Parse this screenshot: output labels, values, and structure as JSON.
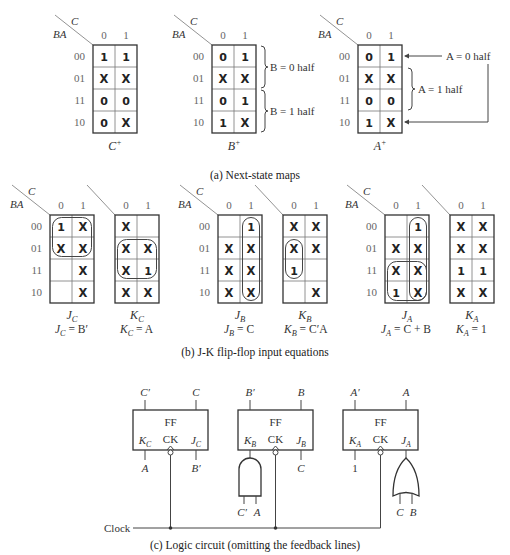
{
  "section_a": {
    "caption": "(a) Next-state maps",
    "col_var": "C",
    "row_var": "BA",
    "col_labels": [
      "0",
      "1"
    ],
    "row_labels": [
      "00",
      "01",
      "11",
      "10"
    ],
    "maps": [
      {
        "id": "C_next",
        "title": "C",
        "title_sup": "+",
        "x": 93,
        "y": 45,
        "cells": [
          [
            "1",
            "1"
          ],
          [
            "X",
            "X"
          ],
          [
            "0",
            "0"
          ],
          [
            "0",
            "X"
          ]
        ]
      },
      {
        "id": "B_next",
        "title": "B",
        "title_sup": "+",
        "x": 212,
        "y": 45,
        "cells": [
          [
            "0",
            "1"
          ],
          [
            "X",
            "X"
          ],
          [
            "0",
            "1"
          ],
          [
            "1",
            "X"
          ]
        ]
      },
      {
        "id": "A_next",
        "title": "A",
        "title_sup": "+",
        "x": 358,
        "y": 45,
        "cells": [
          [
            "0",
            "1"
          ],
          [
            "X",
            "X"
          ],
          [
            "0",
            "0"
          ],
          [
            "1",
            "X"
          ]
        ]
      }
    ],
    "annotations": {
      "b0_half": "B = 0 half",
      "b1_half": "B = 1 half",
      "a0_half": "A = 0 half",
      "a1_half": "A = 1 half"
    }
  },
  "section_b": {
    "caption": "(b) J-K flip-flop input equations",
    "maps": [
      {
        "id": "JC",
        "title": "J",
        "sub": "C",
        "x": 50,
        "y": 215,
        "show_axes": true,
        "cells": [
          [
            "1",
            "X"
          ],
          [
            "X",
            "X"
          ],
          [
            "",
            "X"
          ],
          [
            "",
            "X"
          ]
        ],
        "loops": [
          {
            "r0": 0,
            "c0": 0,
            "r1": 1,
            "c1": 1
          }
        ]
      },
      {
        "id": "KC",
        "title": "K",
        "sub": "C",
        "x": 115,
        "y": 215,
        "show_axes": false,
        "cells": [
          [
            "X",
            ""
          ],
          [
            "X",
            "X"
          ],
          [
            "X",
            "1"
          ],
          [
            "X",
            "X"
          ]
        ],
        "loops": [
          {
            "r0": 1,
            "c0": 0,
            "r1": 2,
            "c1": 1
          }
        ]
      },
      {
        "id": "JB",
        "title": "J",
        "sub": "B",
        "x": 218,
        "y": 215,
        "show_axes": true,
        "cells": [
          [
            "",
            "1"
          ],
          [
            "X",
            "X"
          ],
          [
            "X",
            "X"
          ],
          [
            "X",
            "X"
          ]
        ],
        "loops": [
          {
            "r0": 0,
            "c0": 1,
            "r1": 3,
            "c1": 1
          }
        ]
      },
      {
        "id": "KB",
        "title": "K",
        "sub": "B",
        "x": 283,
        "y": 215,
        "show_axes": false,
        "cells": [
          [
            "X",
            "X"
          ],
          [
            "X",
            "X"
          ],
          [
            "1",
            ""
          ],
          [
            "",
            "X"
          ]
        ],
        "loops": [
          {
            "r0": 1,
            "c0": 0,
            "r1": 2,
            "c1": 0
          }
        ]
      },
      {
        "id": "JA",
        "title": "J",
        "sub": "A",
        "x": 385,
        "y": 215,
        "show_axes": true,
        "cells": [
          [
            "",
            "1"
          ],
          [
            "X",
            "X"
          ],
          [
            "X",
            "X"
          ],
          [
            "1",
            "X"
          ]
        ],
        "loops": [
          {
            "r0": 0,
            "c0": 1,
            "r1": 3,
            "c1": 1
          },
          {
            "r0": 2,
            "c0": 0,
            "r1": 3,
            "c1": 1
          }
        ]
      },
      {
        "id": "KA",
        "title": "K",
        "sub": "A",
        "x": 450,
        "y": 215,
        "show_axes": false,
        "cells": [
          [
            "X",
            "X"
          ],
          [
            "X",
            "X"
          ],
          [
            "1",
            "1"
          ],
          [
            "X",
            "X"
          ]
        ],
        "loops": []
      }
    ],
    "equations": [
      {
        "lhs": "J",
        "sub": "C",
        "rhs": " = B′",
        "x": 55
      },
      {
        "lhs": "K",
        "sub": "C",
        "rhs": " = A",
        "x": 120
      },
      {
        "lhs": "J",
        "sub": "B",
        "rhs": " = C",
        "x": 224
      },
      {
        "lhs": "K",
        "sub": "B",
        "rhs": " = C′A",
        "x": 284
      },
      {
        "lhs": "J",
        "sub": "A",
        "rhs": " = C + B",
        "x": 381
      },
      {
        "lhs": "K",
        "sub": "A",
        "rhs": " = 1",
        "x": 456
      }
    ]
  },
  "section_c": {
    "caption": "(c) Logic circuit (omitting the feedback lines)",
    "clock_label": "Clock",
    "flip_flops": [
      {
        "id": "FF_C",
        "x": 133,
        "label": "FF",
        "ck": "CK",
        "q_bar": "C′",
        "q": "C",
        "k": "K",
        "k_sub": "C",
        "j": "J",
        "j_sub": "C",
        "k_in": "A",
        "j_in": "B′"
      },
      {
        "id": "FF_B",
        "x": 238,
        "label": "FF",
        "ck": "CK",
        "q_bar": "B′",
        "q": "B",
        "k": "K",
        "k_sub": "B",
        "j": "J",
        "j_sub": "B",
        "k_gate": "AND",
        "k_gate_in": [
          "C′",
          "A"
        ],
        "j_in": "C"
      },
      {
        "id": "FF_A",
        "x": 343,
        "label": "FF",
        "ck": "CK",
        "q_bar": "A′",
        "q": "A",
        "k": "K",
        "k_sub": "A",
        "j": "J",
        "j_sub": "A",
        "k_in": "1",
        "j_gate": "OR",
        "j_gate_in": [
          "C",
          "B"
        ]
      }
    ]
  }
}
